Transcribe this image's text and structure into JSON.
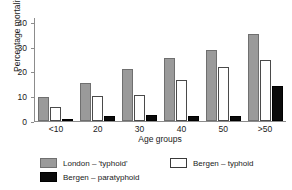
{
  "chart_data": {
    "type": "bar",
    "title": "",
    "xlabel": "Age groups",
    "ylabel": "Percentage mortality",
    "categories": [
      "<10",
      "20",
      "30",
      "40",
      "50",
      ">50"
    ],
    "ylim": [
      0,
      42
    ],
    "yticks": [
      0,
      10,
      20,
      30,
      40
    ],
    "ytick_labels": [
      "0",
      "10",
      "20",
      "30",
      "40"
    ],
    "grid": false,
    "legend_position": "bottom",
    "series": [
      {
        "name": "London – 'typhoid'",
        "color": "#9a9a9a",
        "values": [
          9.5,
          15.5,
          21,
          25.5,
          28.5,
          35
        ]
      },
      {
        "name": "Bergen – typhoid",
        "color": "#ffffff",
        "values": [
          5.5,
          10,
          10.5,
          16.5,
          22,
          24.5
        ]
      },
      {
        "name": "Bergen – paratyphoid",
        "color": "#0a0a0a",
        "values": [
          1,
          2,
          2.5,
          2,
          2,
          14
        ]
      }
    ]
  },
  "axis": {
    "y_title": "Percentage mortality",
    "x_title": "Age groups"
  },
  "legend": {
    "items": [
      {
        "label": "London – 'typhoid'",
        "swatch": "london"
      },
      {
        "label": "Bergen – typhoid",
        "swatch": "bergen-typhoid"
      },
      {
        "label": "Bergen – paratyphoid",
        "swatch": "bergen-para"
      }
    ]
  }
}
